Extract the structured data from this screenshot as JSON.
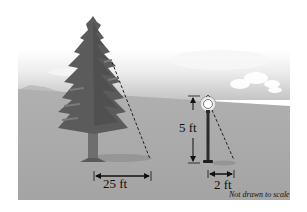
{
  "diagram": {
    "labels": {
      "tree_shadow": "25 ft",
      "post_height": "5 ft",
      "post_shadow": "2 ft",
      "note": "Not drawn to scale"
    },
    "objects": [
      "tree",
      "lamp-post"
    ],
    "colors": {
      "ground": "#a8a8a8",
      "sky_top": "#ffffff",
      "sky_bottom": "#cfcfcf",
      "tree": "#5a5a5a",
      "post": "#2a2a2a",
      "annotation": "#111111"
    }
  }
}
